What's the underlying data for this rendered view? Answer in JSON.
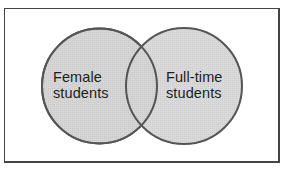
{
  "diagram": {
    "type": "venn",
    "sets": [
      {
        "id": "female",
        "label_lines": [
          "Female",
          "students"
        ],
        "label": "Female students"
      },
      {
        "id": "fulltime",
        "label_lines": [
          "Full-time",
          "students"
        ],
        "label": "Full-time students"
      }
    ],
    "colors": {
      "fill": "#d3d3d3",
      "stroke": "#555555",
      "frame": "#444444",
      "text": "#1e1e1e"
    }
  }
}
